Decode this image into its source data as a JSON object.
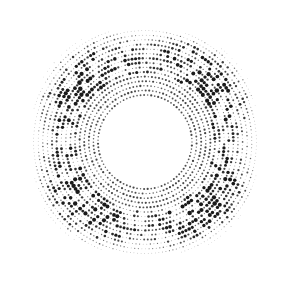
{
  "image": {
    "description": "Halftone dotted circular ring pattern",
    "width": 288,
    "height": 287,
    "background": "#ffffff",
    "dot_color": "#1a1a1a"
  },
  "pattern": {
    "center": [
      145,
      142
    ],
    "inner_radius": 47,
    "outer_radius": 128,
    "ring_spacing": 4.6,
    "dots_per_ring_base": 150,
    "max_dot_radius": 2.4,
    "min_dot_radius": 0.35,
    "inner_fine_rings": 5
  }
}
